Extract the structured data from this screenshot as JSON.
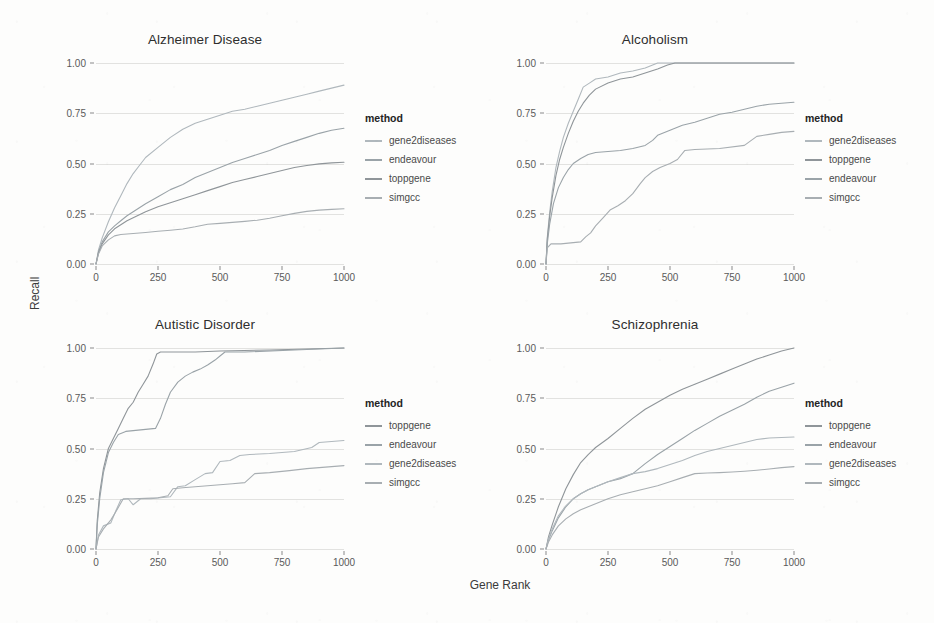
{
  "figure": {
    "xlabel": "Gene Rank",
    "ylabel": "Recall",
    "legend_title": "method"
  },
  "chart_data": [
    {
      "type": "line",
      "title": "Alzheimer Disease",
      "xlabel": "Gene Rank",
      "ylabel": "Recall",
      "xlim": [
        0,
        1000
      ],
      "ylim": [
        0,
        1.0
      ],
      "xticks": [
        "0",
        "250",
        "500",
        "750",
        "1000"
      ],
      "yticks": [
        "0.00",
        "0.25",
        "0.50",
        "0.75",
        "1.00"
      ],
      "grid": true,
      "legend_position": "right",
      "legend_title": "method",
      "series": [
        {
          "name": "gene2diseases",
          "color": "#b0b8bd",
          "x": [
            0,
            10,
            25,
            50,
            75,
            100,
            125,
            150,
            175,
            200,
            250,
            300,
            350,
            400,
            450,
            500,
            550,
            600,
            650,
            700,
            750,
            800,
            850,
            900,
            950,
            1000
          ],
          "y": [
            0.0,
            0.07,
            0.13,
            0.21,
            0.28,
            0.34,
            0.4,
            0.45,
            0.49,
            0.53,
            0.58,
            0.63,
            0.67,
            0.7,
            0.72,
            0.74,
            0.76,
            0.77,
            0.785,
            0.8,
            0.815,
            0.83,
            0.845,
            0.86,
            0.875,
            0.89
          ]
        },
        {
          "name": "endeavour",
          "color": "#9aa3a8",
          "x": [
            0,
            10,
            25,
            50,
            75,
            100,
            125,
            150,
            175,
            200,
            250,
            300,
            350,
            400,
            450,
            500,
            550,
            600,
            650,
            700,
            750,
            800,
            850,
            900,
            950,
            1000
          ],
          "y": [
            0.0,
            0.06,
            0.11,
            0.16,
            0.19,
            0.215,
            0.24,
            0.26,
            0.28,
            0.3,
            0.335,
            0.37,
            0.395,
            0.43,
            0.455,
            0.48,
            0.505,
            0.525,
            0.545,
            0.565,
            0.59,
            0.61,
            0.63,
            0.65,
            0.665,
            0.675
          ]
        },
        {
          "name": "toppgene",
          "color": "#8f9599",
          "x": [
            0,
            10,
            25,
            50,
            75,
            100,
            125,
            150,
            175,
            200,
            250,
            300,
            350,
            400,
            450,
            500,
            550,
            600,
            650,
            700,
            750,
            800,
            850,
            900,
            950,
            1000
          ],
          "y": [
            0.0,
            0.055,
            0.1,
            0.145,
            0.175,
            0.195,
            0.215,
            0.23,
            0.245,
            0.26,
            0.285,
            0.305,
            0.325,
            0.345,
            0.365,
            0.385,
            0.405,
            0.42,
            0.435,
            0.45,
            0.465,
            0.48,
            0.49,
            0.498,
            0.503,
            0.506
          ]
        },
        {
          "name": "simgcc",
          "color": "#a8aeb2",
          "x": [
            0,
            10,
            25,
            50,
            75,
            100,
            150,
            200,
            250,
            300,
            350,
            400,
            450,
            500,
            550,
            600,
            650,
            700,
            750,
            800,
            850,
            900,
            950,
            1000
          ],
          "y": [
            0.0,
            0.05,
            0.09,
            0.12,
            0.14,
            0.147,
            0.152,
            0.157,
            0.163,
            0.168,
            0.174,
            0.185,
            0.198,
            0.202,
            0.207,
            0.212,
            0.218,
            0.228,
            0.24,
            0.252,
            0.262,
            0.268,
            0.272,
            0.275
          ]
        }
      ]
    },
    {
      "type": "line",
      "title": "Alcoholism",
      "xlabel": "Gene Rank",
      "ylabel": "Recall",
      "xlim": [
        0,
        1000
      ],
      "ylim": [
        0,
        1.0
      ],
      "xticks": [
        "0",
        "250",
        "500",
        "750",
        "1000"
      ],
      "yticks": [
        "0.00",
        "0.25",
        "0.50",
        "0.75",
        "1.00"
      ],
      "grid": true,
      "legend_position": "right",
      "legend_title": "method",
      "series": [
        {
          "name": "gene2diseases",
          "color": "#b0b8bd",
          "x": [
            0,
            5,
            15,
            25,
            40,
            55,
            70,
            90,
            110,
            130,
            150,
            175,
            200,
            250,
            300,
            350,
            400,
            430,
            450,
            500,
            600,
            800,
            1000
          ],
          "y": [
            0.0,
            0.13,
            0.26,
            0.36,
            0.48,
            0.56,
            0.63,
            0.7,
            0.76,
            0.82,
            0.88,
            0.9,
            0.92,
            0.93,
            0.95,
            0.96,
            0.975,
            0.99,
            1.0,
            1.0,
            1.0,
            1.0,
            1.0
          ]
        },
        {
          "name": "toppgene",
          "color": "#8f9599",
          "x": [
            0,
            5,
            15,
            25,
            40,
            55,
            70,
            90,
            110,
            130,
            150,
            175,
            200,
            250,
            300,
            350,
            400,
            450,
            490,
            520,
            600,
            800,
            1000
          ],
          "y": [
            0.0,
            0.12,
            0.24,
            0.33,
            0.44,
            0.52,
            0.58,
            0.65,
            0.71,
            0.76,
            0.8,
            0.84,
            0.87,
            0.9,
            0.92,
            0.93,
            0.95,
            0.97,
            0.99,
            1.0,
            1.0,
            1.0,
            1.0
          ]
        },
        {
          "name": "endeavour",
          "color": "#9aa3a8",
          "x": [
            0,
            5,
            15,
            30,
            50,
            70,
            90,
            110,
            140,
            170,
            200,
            250,
            300,
            350,
            400,
            430,
            450,
            500,
            550,
            600,
            650,
            700,
            750,
            800,
            850,
            900,
            950,
            1000
          ],
          "y": [
            0.0,
            0.1,
            0.2,
            0.3,
            0.38,
            0.43,
            0.47,
            0.5,
            0.525,
            0.545,
            0.555,
            0.56,
            0.565,
            0.575,
            0.59,
            0.615,
            0.64,
            0.665,
            0.69,
            0.705,
            0.725,
            0.745,
            0.755,
            0.77,
            0.785,
            0.795,
            0.8,
            0.805
          ]
        },
        {
          "name": "simgcc",
          "color": "#a8aeb2",
          "x": [
            0,
            5,
            20,
            60,
            100,
            140,
            160,
            180,
            200,
            230,
            260,
            290,
            320,
            350,
            380,
            400,
            430,
            460,
            500,
            530,
            560,
            600,
            700,
            800,
            850,
            900,
            950,
            1000
          ],
          "y": [
            0.0,
            0.08,
            0.1,
            0.1,
            0.105,
            0.11,
            0.135,
            0.155,
            0.19,
            0.23,
            0.27,
            0.29,
            0.315,
            0.35,
            0.4,
            0.43,
            0.46,
            0.48,
            0.5,
            0.52,
            0.565,
            0.57,
            0.575,
            0.59,
            0.635,
            0.645,
            0.655,
            0.66
          ]
        }
      ]
    },
    {
      "type": "line",
      "title": "Autistic Disorder",
      "xlabel": "Gene Rank",
      "ylabel": "Recall",
      "xlim": [
        0,
        1000
      ],
      "ylim": [
        0,
        1.0
      ],
      "xticks": [
        "0",
        "250",
        "500",
        "750",
        "1000"
      ],
      "yticks": [
        "0.00",
        "0.25",
        "0.50",
        "0.75",
        "1.00"
      ],
      "grid": true,
      "legend_position": "right",
      "legend_title": "method",
      "series": [
        {
          "name": "toppgene",
          "color": "#8f9599",
          "x": [
            0,
            5,
            15,
            30,
            50,
            70,
            90,
            110,
            130,
            150,
            170,
            190,
            210,
            230,
            245,
            260,
            300,
            400,
            500,
            700,
            1000
          ],
          "y": [
            0.0,
            0.14,
            0.28,
            0.4,
            0.5,
            0.55,
            0.6,
            0.65,
            0.7,
            0.73,
            0.78,
            0.82,
            0.86,
            0.92,
            0.97,
            0.98,
            0.98,
            0.98,
            0.985,
            0.99,
            1.0
          ]
        },
        {
          "name": "endeavour",
          "color": "#9aa3a8",
          "x": [
            0,
            5,
            15,
            30,
            50,
            70,
            90,
            120,
            160,
            200,
            240,
            260,
            280,
            300,
            330,
            360,
            390,
            420,
            450,
            480,
            500,
            520,
            600,
            800,
            1000
          ],
          "y": [
            0.0,
            0.12,
            0.25,
            0.38,
            0.48,
            0.53,
            0.57,
            0.585,
            0.59,
            0.595,
            0.6,
            0.65,
            0.72,
            0.78,
            0.83,
            0.86,
            0.88,
            0.895,
            0.915,
            0.94,
            0.96,
            0.98,
            0.98,
            0.99,
            1.0
          ]
        },
        {
          "name": "gene2diseases",
          "color": "#b0b8bd",
          "x": [
            0,
            10,
            30,
            60,
            80,
            100,
            130,
            150,
            180,
            220,
            260,
            300,
            330,
            360,
            400,
            440,
            470,
            500,
            540,
            580,
            620,
            700,
            800,
            870,
            900,
            950,
            1000
          ],
          "y": [
            0.0,
            0.07,
            0.115,
            0.13,
            0.19,
            0.245,
            0.25,
            0.22,
            0.25,
            0.25,
            0.255,
            0.26,
            0.31,
            0.315,
            0.345,
            0.375,
            0.38,
            0.435,
            0.44,
            0.465,
            0.47,
            0.475,
            0.485,
            0.505,
            0.53,
            0.535,
            0.54
          ]
        },
        {
          "name": "simgcc",
          "color": "#a8aeb2",
          "x": [
            0,
            10,
            30,
            60,
            80,
            110,
            150,
            200,
            250,
            290,
            310,
            350,
            400,
            450,
            500,
            550,
            600,
            640,
            700,
            780,
            850,
            900,
            950,
            1000
          ],
          "y": [
            0.0,
            0.06,
            0.1,
            0.145,
            0.185,
            0.25,
            0.25,
            0.252,
            0.255,
            0.265,
            0.3,
            0.305,
            0.31,
            0.315,
            0.32,
            0.325,
            0.33,
            0.375,
            0.38,
            0.39,
            0.4,
            0.405,
            0.41,
            0.415
          ]
        }
      ]
    },
    {
      "type": "line",
      "title": "Schizophrenia",
      "xlabel": "Gene Rank",
      "ylabel": "Recall",
      "xlim": [
        0,
        1000
      ],
      "ylim": [
        0,
        1.0
      ],
      "xticks": [
        "0",
        "250",
        "500",
        "750",
        "1000"
      ],
      "yticks": [
        "0.00",
        "0.25",
        "0.50",
        "0.75",
        "1.00"
      ],
      "grid": true,
      "legend_position": "right",
      "legend_title": "method",
      "series": [
        {
          "name": "toppgene",
          "color": "#8f9599",
          "x": [
            0,
            10,
            25,
            50,
            80,
            110,
            140,
            170,
            200,
            250,
            300,
            350,
            400,
            450,
            500,
            550,
            600,
            650,
            700,
            750,
            800,
            850,
            900,
            950,
            1000
          ],
          "y": [
            0.0,
            0.06,
            0.12,
            0.21,
            0.3,
            0.37,
            0.43,
            0.47,
            0.505,
            0.55,
            0.6,
            0.65,
            0.695,
            0.73,
            0.765,
            0.795,
            0.82,
            0.845,
            0.87,
            0.895,
            0.92,
            0.945,
            0.965,
            0.985,
            1.0
          ]
        },
        {
          "name": "endeavour",
          "color": "#9aa3a8",
          "x": [
            0,
            10,
            25,
            50,
            80,
            110,
            140,
            170,
            200,
            250,
            300,
            350,
            400,
            450,
            500,
            550,
            600,
            650,
            700,
            750,
            800,
            850,
            900,
            950,
            1000
          ],
          "y": [
            0.0,
            0.045,
            0.09,
            0.155,
            0.21,
            0.25,
            0.275,
            0.295,
            0.31,
            0.335,
            0.35,
            0.375,
            0.425,
            0.47,
            0.51,
            0.55,
            0.59,
            0.625,
            0.66,
            0.69,
            0.72,
            0.755,
            0.785,
            0.805,
            0.825
          ]
        },
        {
          "name": "gene2diseases",
          "color": "#b0b8bd",
          "x": [
            0,
            10,
            25,
            50,
            80,
            110,
            140,
            170,
            200,
            250,
            300,
            350,
            400,
            450,
            500,
            550,
            600,
            650,
            700,
            750,
            800,
            850,
            900,
            950,
            1000
          ],
          "y": [
            0.0,
            0.05,
            0.1,
            0.165,
            0.215,
            0.25,
            0.275,
            0.295,
            0.31,
            0.335,
            0.355,
            0.375,
            0.385,
            0.4,
            0.42,
            0.44,
            0.465,
            0.485,
            0.5,
            0.515,
            0.53,
            0.545,
            0.552,
            0.555,
            0.557
          ]
        },
        {
          "name": "simgcc",
          "color": "#a8aeb2",
          "x": [
            0,
            10,
            25,
            50,
            80,
            110,
            140,
            170,
            200,
            250,
            300,
            350,
            400,
            450,
            500,
            550,
            600,
            650,
            700,
            750,
            800,
            850,
            900,
            950,
            1000
          ],
          "y": [
            0.0,
            0.035,
            0.07,
            0.115,
            0.15,
            0.175,
            0.195,
            0.21,
            0.225,
            0.25,
            0.27,
            0.285,
            0.3,
            0.315,
            0.335,
            0.355,
            0.375,
            0.378,
            0.38,
            0.383,
            0.387,
            0.392,
            0.398,
            0.405,
            0.41
          ]
        }
      ]
    }
  ]
}
